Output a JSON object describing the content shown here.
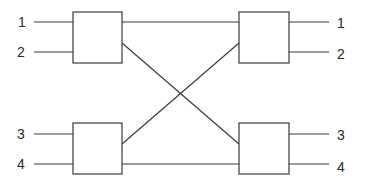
{
  "diagram": {
    "type": "crossbar-switch-network",
    "colors": {
      "stroke": "#3a3a3a",
      "text": "#2a2a2a",
      "background": "#ffffff"
    },
    "inputs": [
      {
        "label": "1"
      },
      {
        "label": "2"
      },
      {
        "label": "3"
      },
      {
        "label": "4"
      }
    ],
    "outputs": [
      {
        "label": "1"
      },
      {
        "label": "2"
      },
      {
        "label": "3"
      },
      {
        "label": "4"
      }
    ],
    "switches": [
      {
        "id": "switch-top-left"
      },
      {
        "id": "switch-bottom-left"
      },
      {
        "id": "switch-top-right"
      },
      {
        "id": "switch-bottom-right"
      }
    ],
    "connections": [
      {
        "from": "switch-top-left",
        "to": "switch-top-right",
        "kind": "straight"
      },
      {
        "from": "switch-top-left",
        "to": "switch-bottom-right",
        "kind": "cross"
      },
      {
        "from": "switch-bottom-left",
        "to": "switch-top-right",
        "kind": "cross"
      },
      {
        "from": "switch-bottom-left",
        "to": "switch-bottom-right",
        "kind": "straight"
      }
    ]
  }
}
